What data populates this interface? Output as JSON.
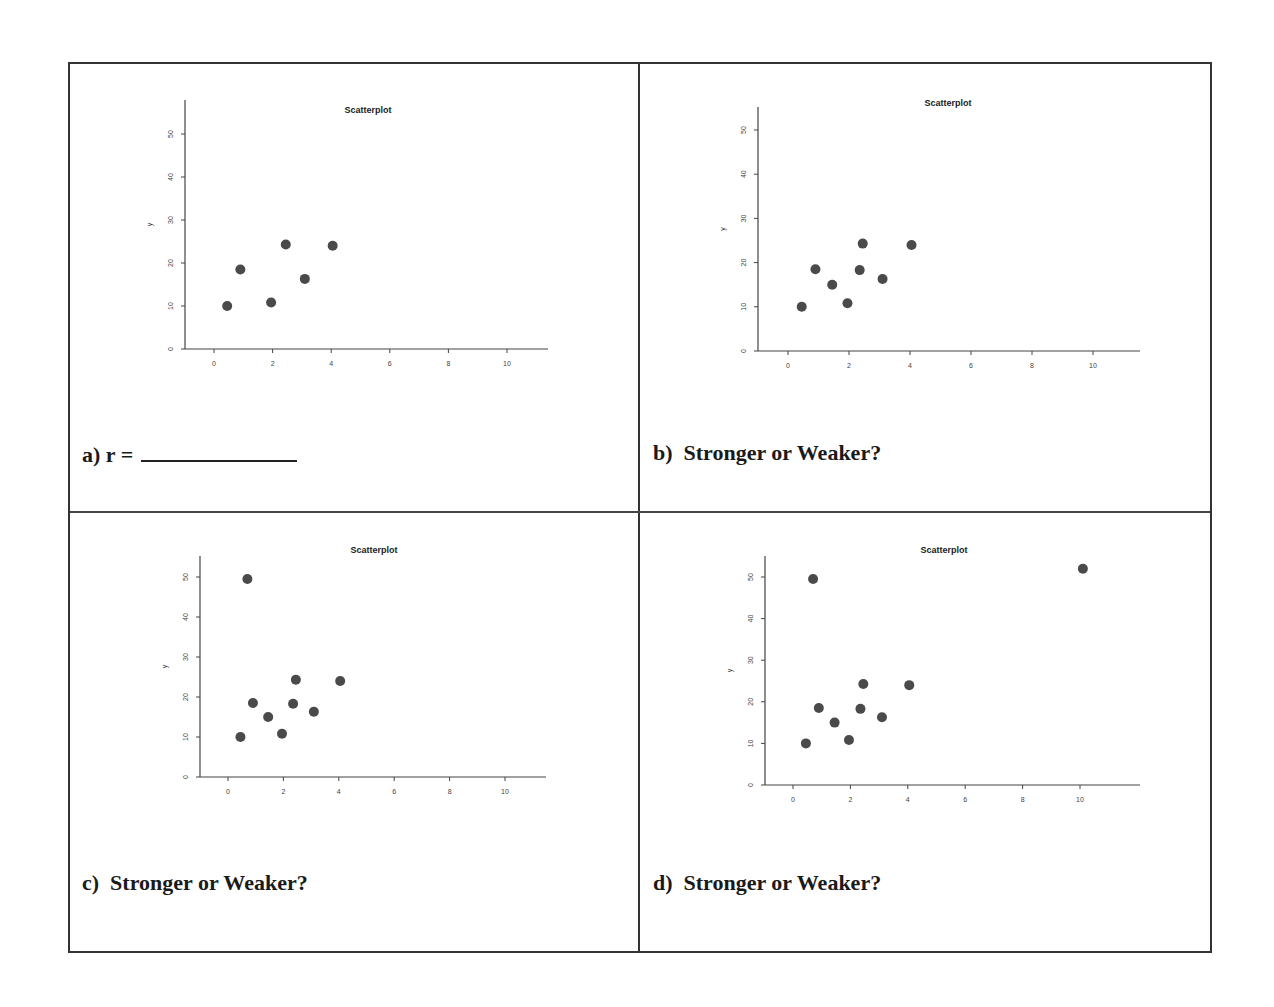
{
  "page": {
    "panels": [
      {
        "id": "a",
        "caption_prefix": "a) r =",
        "caption_blank": true,
        "question": ""
      },
      {
        "id": "b",
        "caption_prefix": "b)",
        "question": "Stronger or Weaker?"
      },
      {
        "id": "c",
        "caption_prefix": "c)",
        "question": "Stronger or Weaker?"
      },
      {
        "id": "d",
        "caption_prefix": "d)",
        "question": "Stronger or Weaker?"
      }
    ]
  },
  "chart_data": [
    {
      "type": "scatter",
      "panel": "a",
      "title": "Scatterplot",
      "xlabel": "",
      "ylabel": "y",
      "xlim": [
        -1,
        11.5
      ],
      "ylim": [
        0,
        55
      ],
      "xticks": [
        0,
        2,
        4,
        6,
        8,
        10
      ],
      "yticks": [
        0,
        10,
        20,
        30,
        40,
        50
      ],
      "grid": false,
      "x": [
        0.45,
        0.9,
        1.95,
        2.45,
        3.1,
        4.05
      ],
      "y": [
        10,
        18.5,
        10.8,
        24.3,
        16.3,
        24
      ]
    },
    {
      "type": "scatter",
      "panel": "b",
      "title": "Scatterplot",
      "xlabel": "",
      "ylabel": "y",
      "xlim": [
        -1,
        11.5
      ],
      "ylim": [
        0,
        55
      ],
      "xticks": [
        0,
        2,
        4,
        6,
        8,
        10
      ],
      "yticks": [
        0,
        10,
        20,
        30,
        40,
        50
      ],
      "grid": false,
      "x": [
        0.45,
        0.9,
        1.45,
        1.95,
        2.35,
        2.45,
        3.1,
        4.05
      ],
      "y": [
        10,
        18.5,
        15,
        10.8,
        18.3,
        24.3,
        16.3,
        24
      ]
    },
    {
      "type": "scatter",
      "panel": "c",
      "title": "Scatterplot",
      "xlabel": "",
      "ylabel": "y",
      "xlim": [
        -1,
        11.5
      ],
      "ylim": [
        0,
        55
      ],
      "xticks": [
        0,
        2,
        4,
        6,
        8,
        10
      ],
      "yticks": [
        0,
        10,
        20,
        30,
        40,
        50
      ],
      "grid": false,
      "x": [
        0.45,
        0.7,
        0.9,
        1.45,
        1.95,
        2.35,
        2.45,
        3.1,
        4.05
      ],
      "y": [
        10,
        49.5,
        18.5,
        15,
        10.8,
        18.3,
        24.3,
        16.3,
        24
      ]
    },
    {
      "type": "scatter",
      "panel": "d",
      "title": "Scatterplot",
      "xlabel": "",
      "ylabel": "y",
      "xlim": [
        -1,
        11.5
      ],
      "ylim": [
        0,
        55
      ],
      "xticks": [
        0,
        2,
        4,
        6,
        8,
        10
      ],
      "yticks": [
        0,
        10,
        20,
        30,
        40,
        50
      ],
      "grid": false,
      "x": [
        0.45,
        0.7,
        0.9,
        1.45,
        1.95,
        2.35,
        2.45,
        3.1,
        4.05,
        10.1
      ],
      "y": [
        10,
        49.5,
        18.5,
        15,
        10.8,
        18.3,
        24.3,
        16.3,
        24,
        52
      ]
    }
  ],
  "plot_layout": [
    {
      "axis_x": 185,
      "x0": 214,
      "xunit": 29.3,
      "y0": 349,
      "yunit": 4.3,
      "top": 100,
      "right": 548,
      "title_y": 113,
      "title_x": 368
    },
    {
      "axis_x": 758,
      "x0": 788,
      "xunit": 30.5,
      "y0": 351,
      "yunit": 4.42,
      "top": 107,
      "right": 1140,
      "title_y": 106,
      "title_x": 948
    },
    {
      "axis_x": 200,
      "x0": 228,
      "xunit": 27.7,
      "y0": 777,
      "yunit": 4.0,
      "top": 556,
      "right": 546,
      "title_y": 553,
      "title_x": 374
    },
    {
      "axis_x": 765,
      "x0": 793,
      "xunit": 28.7,
      "y0": 785,
      "yunit": 4.16,
      "top": 556,
      "right": 1140,
      "title_y": 553,
      "title_x": 944
    }
  ]
}
